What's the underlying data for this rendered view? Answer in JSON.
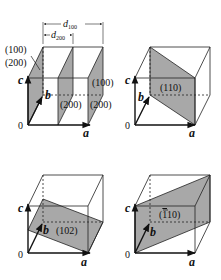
{
  "figure": {
    "colors": {
      "plane_fill": "#a8a8a8",
      "edge": "#222222"
    },
    "axes": {
      "a": "a",
      "b": "b",
      "c": "c",
      "origin": "0"
    },
    "panels": [
      {
        "id": "p100_200",
        "plane_labels": [
          "(100)",
          "(200)",
          "(100)",
          "(200)",
          "(200)"
        ],
        "left_labels": {
          "top": "(100)",
          "bottom": "(200)"
        },
        "right_labels": {
          "top": "(100)",
          "bottom": "(200)"
        },
        "mid_label": "(200)",
        "spacings": {
          "d100": "d",
          "d100_sub": "100",
          "d200": "d",
          "d200_sub": "200"
        }
      },
      {
        "id": "p110",
        "plane_label": "(110)"
      },
      {
        "id": "p102",
        "plane_label": "(102)"
      },
      {
        "id": "p-110",
        "plane_label": "(̄110)",
        "plane_label_bar": "1",
        "plane_label_rest": "10)"
      }
    ]
  }
}
